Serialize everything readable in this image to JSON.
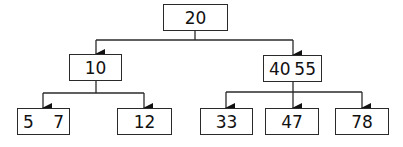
{
  "diagram": {
    "type": "b-tree",
    "root": {
      "keys": [
        "20"
      ]
    },
    "level1": [
      {
        "keys": [
          "10"
        ]
      },
      {
        "keys": [
          "40",
          "55"
        ]
      }
    ],
    "level2": [
      {
        "keys": [
          "5",
          "7"
        ]
      },
      {
        "keys": [
          "12"
        ]
      },
      {
        "keys": [
          "33"
        ]
      },
      {
        "keys": [
          "47"
        ]
      },
      {
        "keys": [
          "78"
        ]
      }
    ],
    "colors": {
      "stroke": "#2a2a2a",
      "background": "#ffffff",
      "text": "#111111"
    }
  }
}
